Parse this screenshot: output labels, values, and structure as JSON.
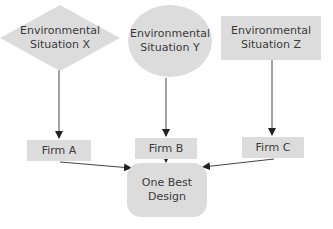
{
  "diagram": {
    "situations": [
      {
        "shape": "diamond",
        "line1": "Environmental",
        "line2": "Situation X"
      },
      {
        "shape": "circle",
        "line1": "Environmental",
        "line2": "Situation Y"
      },
      {
        "shape": "rectangle",
        "line1": "Environmental",
        "line2": "Situation Z"
      }
    ],
    "firms": [
      "Firm A",
      "Firm B",
      "Firm C"
    ],
    "outcome": {
      "line1": "One Best",
      "line2": "Design"
    },
    "colors": {
      "box_fill": "#dcdcdc",
      "arrow": "#222222",
      "text": "#3a3a3a"
    }
  }
}
